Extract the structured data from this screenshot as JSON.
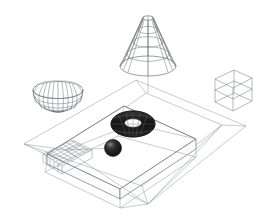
{
  "scene": {
    "title": "3D Wireframe Scene",
    "background_color": "#ffffff",
    "projection": "isometric",
    "line_color": "#555a5e",
    "faint_line_color": "#9aa0a5",
    "solid_color": "#1b1b1b",
    "objects": [
      {
        "name": "ground-plane",
        "label": "Ground Plane",
        "type": "plane",
        "shading": "wireframe",
        "color": "#9aa0a5"
      },
      {
        "name": "slab-platform",
        "label": "Slab Platform",
        "type": "box",
        "shading": "wireframe",
        "color": "#555a5e"
      },
      {
        "name": "grid-mesh-patch",
        "label": "Grid Mesh Patch",
        "type": "grid",
        "shading": "wireframe",
        "color": "#7b8087"
      },
      {
        "name": "cone",
        "label": "Cone",
        "type": "cone",
        "shading": "wireframe",
        "color": "#555a5e"
      },
      {
        "name": "hemisphere-bowl",
        "label": "Hemisphere Bowl",
        "type": "hemisphere",
        "shading": "wireframe",
        "color": "#555a5e"
      },
      {
        "name": "wire-box",
        "label": "Wire Box",
        "type": "box",
        "shading": "wireframe",
        "color": "#8a9096"
      },
      {
        "name": "torus",
        "label": "Torus",
        "type": "torus",
        "shading": "solid",
        "color": "#1b1b1b"
      },
      {
        "name": "sphere",
        "label": "Sphere",
        "type": "sphere",
        "shading": "solid",
        "color": "#1b1b1b"
      }
    ]
  }
}
